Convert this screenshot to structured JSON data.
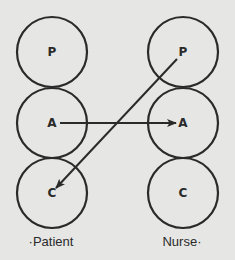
{
  "diagram": {
    "type": "transactional-analysis-ego-states",
    "columns": [
      {
        "label": "Patient",
        "label_display": "·Patient",
        "states": [
          {
            "key": "P",
            "label": "P"
          },
          {
            "key": "A",
            "label": "A"
          },
          {
            "key": "C",
            "label": "C"
          }
        ]
      },
      {
        "label": "Nurse",
        "label_display": "Nurse·",
        "states": [
          {
            "key": "P",
            "label": "P"
          },
          {
            "key": "A",
            "label": "A"
          },
          {
            "key": "C",
            "label": "C"
          }
        ]
      }
    ],
    "transactions": [
      {
        "from": "Patient.A",
        "to": "Nurse.A",
        "style": "arrow"
      },
      {
        "from": "Nurse.P",
        "to": "Patient.C",
        "style": "arrow"
      }
    ],
    "colors": {
      "background": "#e6e6e4",
      "ink": "#2a2a2a"
    }
  }
}
